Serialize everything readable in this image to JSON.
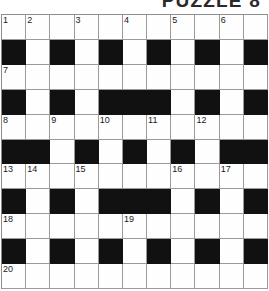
{
  "page": {
    "title": "PUZZLE 8",
    "background_color": "#ffffff"
  },
  "grid": {
    "rows": 11,
    "cols": 11,
    "block_color": "#111111",
    "cell_color": "#fefefe",
    "grid_line_color": "#9a9a9a",
    "number_color": "#1a1a1a",
    "blocks": [
      [],
      [
        0,
        2,
        4,
        6,
        8,
        10
      ],
      [],
      [
        0,
        2,
        4,
        5,
        6,
        8,
        10
      ],
      [],
      [
        0,
        1,
        3,
        5,
        7,
        9,
        10
      ],
      [],
      [
        0,
        2,
        4,
        5,
        6,
        8,
        10
      ],
      [],
      [
        0,
        2,
        4,
        6,
        8,
        10
      ],
      []
    ],
    "numbers": [
      {
        "row": 0,
        "col": 0,
        "label": "1"
      },
      {
        "row": 0,
        "col": 1,
        "label": "2"
      },
      {
        "row": 0,
        "col": 3,
        "label": "3"
      },
      {
        "row": 0,
        "col": 5,
        "label": "4"
      },
      {
        "row": 0,
        "col": 7,
        "label": "5"
      },
      {
        "row": 0,
        "col": 9,
        "label": "6"
      },
      {
        "row": 2,
        "col": 0,
        "label": "7"
      },
      {
        "row": 4,
        "col": 0,
        "label": "8"
      },
      {
        "row": 4,
        "col": 2,
        "label": "9"
      },
      {
        "row": 4,
        "col": 4,
        "label": "10"
      },
      {
        "row": 4,
        "col": 6,
        "label": "11"
      },
      {
        "row": 4,
        "col": 8,
        "label": "12"
      },
      {
        "row": 6,
        "col": 0,
        "label": "13"
      },
      {
        "row": 6,
        "col": 1,
        "label": "14"
      },
      {
        "row": 6,
        "col": 3,
        "label": "15"
      },
      {
        "row": 6,
        "col": 7,
        "label": "16"
      },
      {
        "row": 6,
        "col": 9,
        "label": "17"
      },
      {
        "row": 8,
        "col": 0,
        "label": "18"
      },
      {
        "row": 8,
        "col": 5,
        "label": "19"
      },
      {
        "row": 10,
        "col": 0,
        "label": "20"
      }
    ],
    "entries": []
  }
}
